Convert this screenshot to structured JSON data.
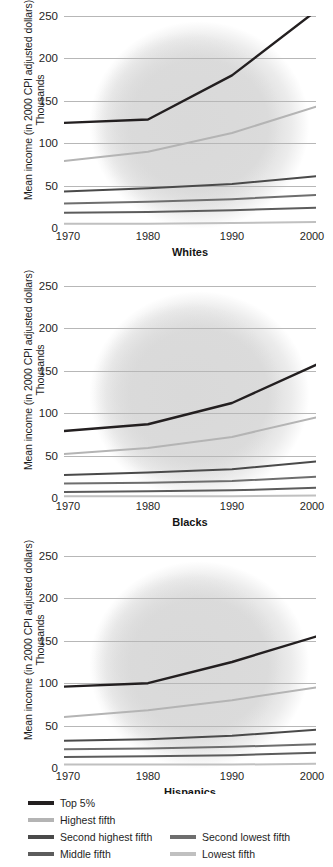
{
  "axis": {
    "y_title_line1": "Mean income (in 2000 CPI adjusted dollars)",
    "y_title_line2": "Thousands",
    "yticks": [
      "0",
      "50",
      "100",
      "150",
      "200",
      "250"
    ],
    "xticks": [
      "1970",
      "1980",
      "1990",
      "2000"
    ]
  },
  "legend": {
    "items": [
      {
        "label": "Top 5%",
        "color": "#231f20"
      },
      {
        "label": "Highest fifth",
        "color": "#b4b4b4"
      },
      {
        "label": "Second highest fifth",
        "color": "#4a4a4a"
      },
      {
        "label": "Second lowest fifth",
        "color": "#6e6e6e"
      },
      {
        "label": "Middle fifth",
        "color": "#5c5c5c"
      },
      {
        "label": "Lowest fifth",
        "color": "#c0c0c0"
      }
    ]
  },
  "chart_data": [
    {
      "type": "line",
      "title": "Whites",
      "xlabel": "",
      "ylabel": "Mean income (in 2000 CPI adjusted dollars) Thousands",
      "x": [
        1970,
        1980,
        1990,
        2000
      ],
      "xlim": [
        1970,
        2000
      ],
      "ylim": [
        0,
        250
      ],
      "yticks": [
        0,
        50,
        100,
        150,
        200,
        250
      ],
      "grid": true,
      "legend_position": "bottom",
      "series": [
        {
          "name": "Top 5%",
          "color": "#231f20",
          "values": [
            124,
            128,
            180,
            256
          ]
        },
        {
          "name": "Highest fifth",
          "color": "#b4b4b4",
          "values": [
            79,
            90,
            112,
            143
          ]
        },
        {
          "name": "Second highest fifth",
          "color": "#4a4a4a",
          "values": [
            43,
            47,
            52,
            61
          ]
        },
        {
          "name": "Second lowest fifth",
          "color": "#6e6e6e",
          "values": [
            29,
            31,
            34,
            39
          ]
        },
        {
          "name": "Middle fifth",
          "color": "#5c5c5c",
          "values": [
            18,
            19,
            21,
            24
          ]
        },
        {
          "name": "Lowest fifth",
          "color": "#c0c0c0",
          "values": [
            5,
            5,
            6,
            7
          ]
        }
      ]
    },
    {
      "type": "line",
      "title": "Blacks",
      "xlabel": "",
      "ylabel": "Mean income (in 2000 CPI adjusted dollars) Thousands",
      "x": [
        1970,
        1980,
        1990,
        2000
      ],
      "xlim": [
        1970,
        2000
      ],
      "ylim": [
        0,
        250
      ],
      "yticks": [
        0,
        50,
        100,
        150,
        200,
        250
      ],
      "grid": true,
      "legend_position": "bottom",
      "series": [
        {
          "name": "Top 5%",
          "color": "#231f20",
          "values": [
            79,
            87,
            112,
            157
          ]
        },
        {
          "name": "Highest fifth",
          "color": "#b4b4b4",
          "values": [
            52,
            59,
            72,
            95
          ]
        },
        {
          "name": "Second highest fifth",
          "color": "#4a4a4a",
          "values": [
            27,
            30,
            34,
            43
          ]
        },
        {
          "name": "Second lowest fifth",
          "color": "#6e6e6e",
          "values": [
            17,
            18,
            20,
            25
          ]
        },
        {
          "name": "Middle fifth",
          "color": "#5c5c5c",
          "values": [
            7,
            8,
            9,
            12
          ]
        },
        {
          "name": "Lowest fifth",
          "color": "#c0c0c0",
          "values": [
            2,
            2,
            2,
            3
          ]
        }
      ]
    },
    {
      "type": "line",
      "title": "Hispanics",
      "xlabel": "",
      "ylabel": "Mean income (in 2000 CPI adjusted dollars) Thousands",
      "x": [
        1970,
        1980,
        1990,
        2000
      ],
      "xlim": [
        1970,
        2000
      ],
      "ylim": [
        0,
        250
      ],
      "yticks": [
        0,
        50,
        100,
        150,
        200,
        250
      ],
      "grid": true,
      "legend_position": "bottom",
      "series": [
        {
          "name": "Top 5%",
          "color": "#231f20",
          "values": [
            96,
            100,
            125,
            155
          ]
        },
        {
          "name": "Highest fifth",
          "color": "#b4b4b4",
          "values": [
            60,
            68,
            80,
            95
          ]
        },
        {
          "name": "Second highest fifth",
          "color": "#4a4a4a",
          "values": [
            32,
            34,
            38,
            45
          ]
        },
        {
          "name": "Second lowest fifth",
          "color": "#6e6e6e",
          "values": [
            22,
            23,
            25,
            28
          ]
        },
        {
          "name": "Middle fifth",
          "color": "#5c5c5c",
          "values": [
            13,
            14,
            15,
            18
          ]
        },
        {
          "name": "Lowest fifth",
          "color": "#c0c0c0",
          "values": [
            4,
            4,
            4,
            5
          ]
        }
      ]
    }
  ]
}
